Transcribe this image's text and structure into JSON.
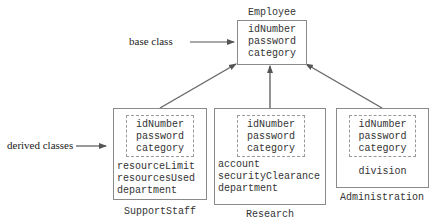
{
  "base": {
    "label": "base class",
    "name": "Employee",
    "fields": [
      "idNumber",
      "password",
      "category"
    ]
  },
  "derived_label": "derived classes",
  "derived": [
    {
      "name": "SupportStaff",
      "inherited": [
        "idNumber",
        "password",
        "category"
      ],
      "own": [
        "resourceLimit",
        "resourcesUsed",
        "department"
      ]
    },
    {
      "name": "Research",
      "inherited": [
        "idNumber",
        "password",
        "category"
      ],
      "own": [
        "account",
        "securityClearance",
        "department"
      ]
    },
    {
      "name": "Administration",
      "inherited": [
        "idNumber",
        "password",
        "category"
      ],
      "own": [
        "division"
      ]
    }
  ]
}
